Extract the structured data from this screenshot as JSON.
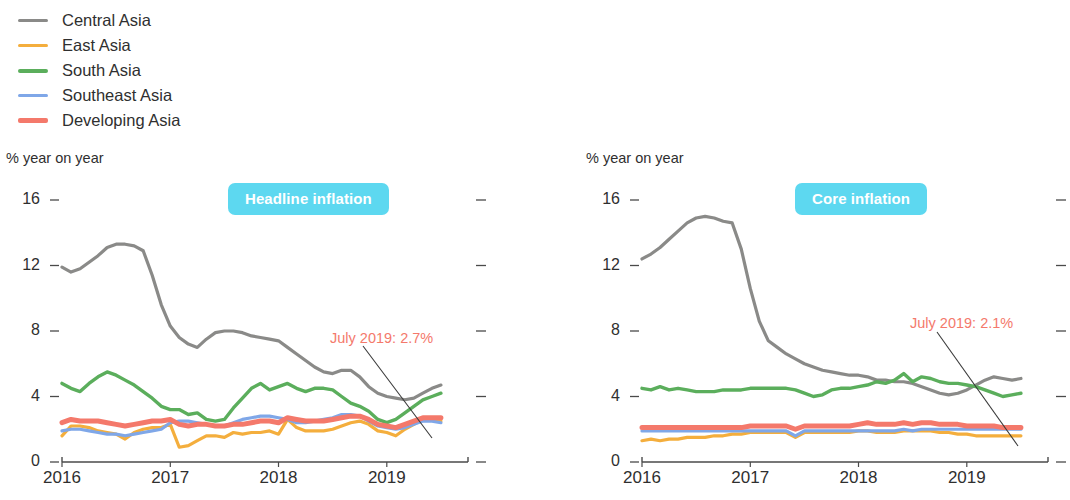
{
  "legend": {
    "items": [
      {
        "label": "Central Asia",
        "color": "#8A8A88",
        "width": 3.5
      },
      {
        "label": "East Asia",
        "color": "#F4AE3D",
        "width": 3.5
      },
      {
        "label": "South Asia",
        "color": "#5BAE5C",
        "width": 4.0
      },
      {
        "label": "Southeast Asia",
        "color": "#7FA7E8",
        "width": 3.5
      },
      {
        "label": "Developing Asia",
        "color": "#F4796B",
        "width": 5.5
      }
    ]
  },
  "colors": {
    "central_asia": "#8A8A88",
    "east_asia": "#F4AE3D",
    "south_asia": "#5BAE5C",
    "southeast_asia": "#7FA7E8",
    "developing_asia": "#F4796B",
    "badge_bg": "#5DD8F0",
    "badge_text": "#FFFFFF",
    "annotation": "#F4796B",
    "axis": "#4A4A4A",
    "leader_line": "#3A3A3A"
  },
  "axis": {
    "unit_label": "% year on year",
    "y_ticks": [
      "16",
      "12",
      "8",
      "4",
      "0"
    ],
    "y_values": [
      16,
      12,
      8,
      4,
      0
    ],
    "ylim": [
      0,
      16
    ],
    "x_ticks": [
      "2016",
      "2017",
      "2018",
      "2019"
    ],
    "x_tick_values": [
      2016,
      2017,
      2018,
      2019
    ],
    "xlim": [
      2016.0,
      2019.75
    ]
  },
  "panels": [
    {
      "key": "headline",
      "badge": "Headline inflation",
      "annotation": "July 2019: 2.7%"
    },
    {
      "key": "core",
      "badge": "Core inflation",
      "annotation": "July 2019: 2.1%"
    }
  ],
  "chart_data": [
    {
      "type": "line",
      "title": "Headline inflation",
      "subtitle": "",
      "xlabel": "",
      "ylabel": "% year on year",
      "ylim": [
        0,
        16
      ],
      "xlim": [
        2016.0,
        2019.58
      ],
      "grid": false,
      "legend_position": "top-left (shared)",
      "x": [
        2016.0,
        2016.083,
        2016.167,
        2016.25,
        2016.333,
        2016.417,
        2016.5,
        2016.583,
        2016.667,
        2016.75,
        2016.833,
        2016.917,
        2017.0,
        2017.083,
        2017.167,
        2017.25,
        2017.333,
        2017.417,
        2017.5,
        2017.583,
        2017.667,
        2017.75,
        2017.833,
        2017.917,
        2018.0,
        2018.083,
        2018.167,
        2018.25,
        2018.333,
        2018.417,
        2018.5,
        2018.583,
        2018.667,
        2018.75,
        2018.833,
        2018.917,
        2019.0,
        2019.083,
        2019.167,
        2019.25,
        2019.333,
        2019.417,
        2019.5
      ],
      "annotations": [
        {
          "text": "July 2019: 2.7%",
          "points_to_series": "Developing Asia",
          "points_to_x": 2019.5,
          "points_to_y": 2.7
        }
      ],
      "series": [
        {
          "name": "Central Asia",
          "color": "#8A8A88",
          "values": [
            11.9,
            11.6,
            11.8,
            12.2,
            12.6,
            13.1,
            13.3,
            13.3,
            13.2,
            12.9,
            11.4,
            9.6,
            8.3,
            7.6,
            7.2,
            7.0,
            7.5,
            7.9,
            8.0,
            8.0,
            7.9,
            7.7,
            7.6,
            7.5,
            7.4,
            7.0,
            6.6,
            6.2,
            5.8,
            5.5,
            5.4,
            5.6,
            5.6,
            5.2,
            4.6,
            4.2,
            4.0,
            3.9,
            3.8,
            3.9,
            4.2,
            4.5,
            4.7
          ]
        },
        {
          "name": "East Asia",
          "color": "#F4AE3D",
          "values": [
            1.6,
            2.2,
            2.2,
            2.1,
            1.9,
            1.8,
            1.7,
            1.4,
            1.8,
            2.0,
            2.1,
            2.1,
            2.3,
            0.9,
            1.0,
            1.3,
            1.6,
            1.6,
            1.5,
            1.8,
            1.7,
            1.8,
            1.8,
            1.9,
            1.7,
            2.6,
            2.1,
            1.9,
            1.9,
            1.9,
            2.0,
            2.2,
            2.4,
            2.5,
            2.3,
            1.9,
            1.8,
            1.6,
            2.0,
            2.3,
            2.6,
            2.6,
            2.5
          ]
        },
        {
          "name": "South Asia",
          "color": "#5BAE5C",
          "values": [
            4.8,
            4.5,
            4.3,
            4.8,
            5.2,
            5.5,
            5.3,
            5.0,
            4.7,
            4.3,
            3.9,
            3.4,
            3.2,
            3.2,
            2.9,
            3.0,
            2.6,
            2.5,
            2.6,
            3.3,
            3.9,
            4.5,
            4.8,
            4.4,
            4.6,
            4.8,
            4.5,
            4.3,
            4.5,
            4.5,
            4.4,
            4.0,
            3.6,
            3.4,
            3.1,
            2.6,
            2.4,
            2.6,
            3.0,
            3.4,
            3.8,
            4.0,
            4.2
          ]
        },
        {
          "name": "Southeast Asia",
          "color": "#7FA7E8",
          "values": [
            1.9,
            2.0,
            2.0,
            1.9,
            1.8,
            1.7,
            1.7,
            1.6,
            1.7,
            1.8,
            1.9,
            2.0,
            2.4,
            2.5,
            2.5,
            2.4,
            2.3,
            2.2,
            2.2,
            2.4,
            2.6,
            2.7,
            2.8,
            2.8,
            2.7,
            2.6,
            2.4,
            2.4,
            2.5,
            2.6,
            2.7,
            2.9,
            2.9,
            2.8,
            2.5,
            2.2,
            2.1,
            2.0,
            2.1,
            2.3,
            2.5,
            2.5,
            2.4
          ]
        },
        {
          "name": "Developing Asia",
          "color": "#F4796B",
          "values": [
            2.4,
            2.6,
            2.5,
            2.5,
            2.5,
            2.4,
            2.3,
            2.2,
            2.3,
            2.4,
            2.5,
            2.5,
            2.6,
            2.3,
            2.2,
            2.3,
            2.3,
            2.2,
            2.2,
            2.3,
            2.3,
            2.4,
            2.5,
            2.5,
            2.4,
            2.7,
            2.6,
            2.5,
            2.5,
            2.5,
            2.6,
            2.7,
            2.8,
            2.8,
            2.6,
            2.3,
            2.2,
            2.1,
            2.3,
            2.5,
            2.7,
            2.7,
            2.7
          ]
        }
      ]
    },
    {
      "type": "line",
      "title": "Core inflation",
      "subtitle": "",
      "xlabel": "",
      "ylabel": "% year on year",
      "ylim": [
        0,
        16
      ],
      "xlim": [
        2016.0,
        2019.58
      ],
      "grid": false,
      "legend_position": "top-left (shared)",
      "x": [
        2016.0,
        2016.083,
        2016.167,
        2016.25,
        2016.333,
        2016.417,
        2016.5,
        2016.583,
        2016.667,
        2016.75,
        2016.833,
        2016.917,
        2017.0,
        2017.083,
        2017.167,
        2017.25,
        2017.333,
        2017.417,
        2017.5,
        2017.583,
        2017.667,
        2017.75,
        2017.833,
        2017.917,
        2018.0,
        2018.083,
        2018.167,
        2018.25,
        2018.333,
        2018.417,
        2018.5,
        2018.583,
        2018.667,
        2018.75,
        2018.833,
        2018.917,
        2019.0,
        2019.083,
        2019.167,
        2019.25,
        2019.333,
        2019.417,
        2019.5
      ],
      "annotations": [
        {
          "text": "July 2019: 2.1%",
          "points_to_series": "Developing Asia",
          "points_to_x": 2019.5,
          "points_to_y": 2.1
        }
      ],
      "series": [
        {
          "name": "Central Asia",
          "color": "#8A8A88",
          "values": [
            12.4,
            12.7,
            13.1,
            13.6,
            14.1,
            14.6,
            14.9,
            15.0,
            14.9,
            14.7,
            14.6,
            13.0,
            10.6,
            8.6,
            7.4,
            7.0,
            6.6,
            6.3,
            6.0,
            5.8,
            5.6,
            5.5,
            5.4,
            5.3,
            5.3,
            5.2,
            5.0,
            5.0,
            4.9,
            4.9,
            4.8,
            4.6,
            4.4,
            4.2,
            4.1,
            4.2,
            4.4,
            4.7,
            5.0,
            5.2,
            5.1,
            5.0,
            5.1
          ]
        },
        {
          "name": "East Asia",
          "color": "#F4AE3D",
          "values": [
            1.3,
            1.4,
            1.3,
            1.4,
            1.4,
            1.5,
            1.5,
            1.5,
            1.6,
            1.6,
            1.7,
            1.7,
            1.8,
            1.8,
            1.8,
            1.8,
            1.8,
            1.5,
            1.8,
            1.8,
            1.8,
            1.8,
            1.8,
            1.8,
            1.9,
            1.9,
            1.8,
            1.8,
            1.8,
            1.9,
            1.9,
            1.9,
            1.9,
            1.8,
            1.8,
            1.7,
            1.7,
            1.6,
            1.6,
            1.6,
            1.6,
            1.6,
            1.6
          ]
        },
        {
          "name": "South Asia",
          "color": "#5BAE5C",
          "values": [
            4.5,
            4.4,
            4.6,
            4.4,
            4.5,
            4.4,
            4.3,
            4.3,
            4.3,
            4.4,
            4.4,
            4.4,
            4.5,
            4.5,
            4.5,
            4.5,
            4.5,
            4.4,
            4.2,
            4.0,
            4.1,
            4.4,
            4.5,
            4.5,
            4.6,
            4.7,
            4.9,
            4.8,
            5.0,
            5.4,
            4.9,
            5.2,
            5.1,
            4.9,
            4.8,
            4.8,
            4.7,
            4.6,
            4.4,
            4.2,
            4.0,
            4.1,
            4.2
          ]
        },
        {
          "name": "Southeast Asia",
          "color": "#7FA7E8",
          "values": [
            1.9,
            1.9,
            1.9,
            1.9,
            1.9,
            1.9,
            1.9,
            1.9,
            1.9,
            1.9,
            1.9,
            1.9,
            1.9,
            1.9,
            1.9,
            1.9,
            1.9,
            1.6,
            1.9,
            1.9,
            1.9,
            1.9,
            1.9,
            1.9,
            1.9,
            1.9,
            1.9,
            1.9,
            1.9,
            2.0,
            1.9,
            2.0,
            2.0,
            2.0,
            2.0,
            2.0,
            2.0,
            2.0,
            2.0,
            2.0,
            2.0,
            2.0,
            2.0
          ]
        },
        {
          "name": "Developing Asia",
          "color": "#F4796B",
          "values": [
            2.1,
            2.1,
            2.1,
            2.1,
            2.1,
            2.1,
            2.1,
            2.1,
            2.1,
            2.1,
            2.1,
            2.1,
            2.2,
            2.2,
            2.2,
            2.2,
            2.2,
            2.0,
            2.2,
            2.2,
            2.2,
            2.2,
            2.2,
            2.2,
            2.3,
            2.4,
            2.3,
            2.3,
            2.3,
            2.4,
            2.3,
            2.4,
            2.4,
            2.3,
            2.3,
            2.3,
            2.2,
            2.2,
            2.2,
            2.2,
            2.1,
            2.1,
            2.1
          ]
        }
      ]
    }
  ]
}
